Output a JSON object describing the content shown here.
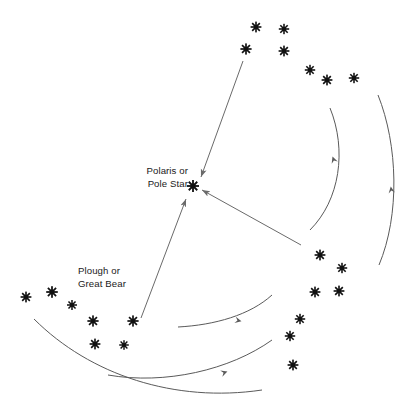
{
  "diagram": {
    "background_color": "#ffffff",
    "star_color": "#111111",
    "line_color": "#6a6a6a",
    "arc_color": "#5a5a5a",
    "text_color": "#1a1a1a",
    "width": 411,
    "height": 412
  },
  "labels": {
    "polaris": {
      "line1": "Polaris or",
      "line2": "Pole Star",
      "x": 188,
      "y": 174,
      "anchor": "end"
    },
    "plough": {
      "line1": "Plough or",
      "line2": "Great Bear",
      "x": 78,
      "y": 274,
      "anchor": "start"
    }
  },
  "stars": {
    "polaris": {
      "x": 193,
      "y": 186,
      "size": 6.0
    },
    "plough_left": [
      {
        "x": 26,
        "y": 297,
        "size": 5.4
      },
      {
        "x": 52,
        "y": 292,
        "size": 5.8
      },
      {
        "x": 72,
        "y": 305,
        "size": 5.0
      },
      {
        "x": 93,
        "y": 321,
        "size": 5.6
      },
      {
        "x": 133,
        "y": 321,
        "size": 5.6
      },
      {
        "x": 95,
        "y": 344,
        "size": 5.4
      },
      {
        "x": 124,
        "y": 345,
        "size": 4.8
      }
    ],
    "plough_top": [
      {
        "x": 256,
        "y": 27,
        "size": 5.4
      },
      {
        "x": 284,
        "y": 29,
        "size": 5.2
      },
      {
        "x": 246,
        "y": 49,
        "size": 5.6
      },
      {
        "x": 284,
        "y": 51,
        "size": 5.4
      },
      {
        "x": 310,
        "y": 70,
        "size": 5.2
      },
      {
        "x": 327,
        "y": 80,
        "size": 5.4
      },
      {
        "x": 354,
        "y": 78,
        "size": 5.2
      }
    ],
    "plough_right": [
      {
        "x": 320,
        "y": 255,
        "size": 5.4
      },
      {
        "x": 342,
        "y": 268,
        "size": 5.2
      },
      {
        "x": 315,
        "y": 292,
        "size": 5.4
      },
      {
        "x": 339,
        "y": 291,
        "size": 5.4
      },
      {
        "x": 300,
        "y": 319,
        "size": 5.2
      },
      {
        "x": 290,
        "y": 336,
        "size": 5.2
      },
      {
        "x": 293,
        "y": 365,
        "size": 5.4
      }
    ]
  },
  "pointer_arrows": [
    {
      "name": "top-plough-to-polaris",
      "x1": 243,
      "y1": 61,
      "x2": 201,
      "y2": 177
    },
    {
      "name": "right-plough-to-polaris",
      "x1": 301,
      "y1": 245,
      "x2": 202,
      "y2": 190
    },
    {
      "name": "left-plough-to-polaris",
      "x1": 141,
      "y1": 318,
      "x2": 186,
      "y2": 199
    }
  ],
  "rotation_arcs": [
    {
      "name": "inner-right-arc",
      "d": "M 310 230 C 340 200 347 150 330 108",
      "arrow_x": 333,
      "arrow_y": 158,
      "arrow_rot": -110
    },
    {
      "name": "outer-right-arc",
      "d": "M 379 265 C 400 215 398 145 378 95",
      "arrow_x": 391,
      "arrow_y": 188,
      "arrow_rot": -99
    },
    {
      "name": "inner-bottom-arc",
      "d": "M 178 327 C 215 325 250 315 272 295",
      "arrow_x": 240,
      "arrow_y": 321,
      "arrow_rot": 13
    },
    {
      "name": "outer-bottom-arc",
      "d": "M 108 375 C 165 385 230 370 272 340",
      "arrow_x": 226,
      "arrow_y": 372,
      "arrow_rot": -19
    },
    {
      "name": "far-outer-arc",
      "d": "M 34 319 C 90 375 175 403 262 390",
      "arrow_x": 0,
      "arrow_y": 0,
      "arrow_rot": 0
    }
  ]
}
